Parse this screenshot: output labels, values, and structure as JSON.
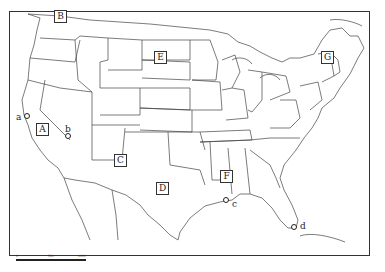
{
  "map": {
    "title": "Map of the contiguous United States with labeled regions",
    "region_labels": [
      {
        "id": "A",
        "x": 36,
        "y": 123
      },
      {
        "id": "B",
        "x": 54,
        "y": 10
      },
      {
        "id": "C",
        "x": 114,
        "y": 154
      },
      {
        "id": "D",
        "x": 156,
        "y": 182
      },
      {
        "id": "E",
        "x": 154,
        "y": 51
      },
      {
        "id": "F",
        "x": 220,
        "y": 170
      },
      {
        "id": "G",
        "x": 321,
        "y": 51
      }
    ],
    "point_labels": [
      {
        "id": "a",
        "label_x": 16,
        "label_y": 113,
        "dot_x": 25,
        "dot_y": 115
      },
      {
        "id": "b",
        "label_x": 65,
        "label_y": 125,
        "dot_x": 66,
        "dot_y": 134
      },
      {
        "id": "c",
        "label_x": 232,
        "label_y": 200,
        "dot_x": 224,
        "dot_y": 198
      },
      {
        "id": "d",
        "label_x": 300,
        "label_y": 222,
        "dot_x": 292,
        "dot_y": 225
      }
    ],
    "scale_bar": {
      "ticks": [
        "0",
        "500",
        "1000 km"
      ]
    }
  }
}
